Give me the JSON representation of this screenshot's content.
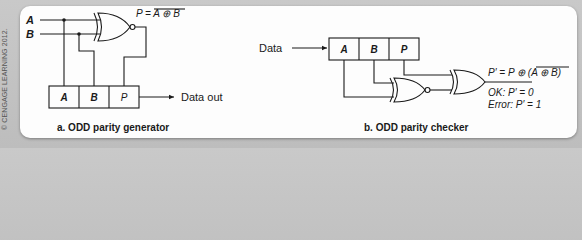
{
  "copyright": "© CENGAGE LEARNING 2012.",
  "generator": {
    "caption": "a. ODD parity generator",
    "input_a": "A",
    "input_b": "B",
    "equation_lhs": "P = ",
    "equation_rhs": "A ⊕ B",
    "register_cells": [
      "A",
      "B",
      "P"
    ],
    "output_label": "Data out",
    "gate": "XNOR"
  },
  "checker": {
    "caption": "b. ODD parity checker",
    "input_label": "Data",
    "register_cells": [
      "A",
      "B",
      "P"
    ],
    "gates": [
      "XNOR",
      "XOR"
    ],
    "equation_lhs": "P′ = P ⊕ (",
    "equation_rhs": "A ⊕ B",
    "equation_close": ")",
    "ok_text": "OK: P′ = 0",
    "error_text": "Error: P′ = 1"
  },
  "colors": {
    "background": "#c4c4c4",
    "panel": "#fdfdfd",
    "ink": "#1a1a1a"
  }
}
